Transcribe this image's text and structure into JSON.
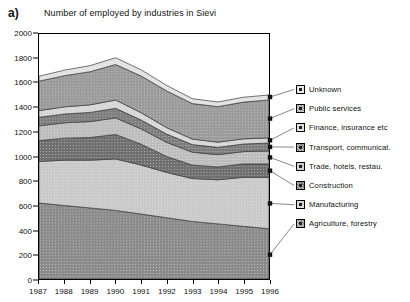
{
  "panel": {
    "label": "a)"
  },
  "chart_data": {
    "type": "area",
    "title": "Number of employed by industries in Sievi",
    "xlabel": "",
    "ylabel": "",
    "stacked": true,
    "grid": false,
    "legend_position": "right",
    "ylim": [
      0,
      2000
    ],
    "yticks": [
      0,
      200,
      400,
      600,
      800,
      1000,
      1200,
      1400,
      1600,
      1800,
      2000
    ],
    "categories": [
      "1987",
      "1988",
      "1989",
      "1990",
      "1991",
      "1992",
      "1993",
      "1994",
      "1995",
      "1996"
    ],
    "x": [
      1987,
      1988,
      1989,
      1990,
      1991,
      1992,
      1993,
      1994,
      1995,
      1996
    ],
    "series": [
      {
        "name": "Agriculture, forestry",
        "color": "#8a8a8a",
        "values": [
          620,
          600,
          580,
          560,
          530,
          500,
          470,
          450,
          430,
          410
        ]
      },
      {
        "name": "Manufacturing",
        "color": "#c9c9c9",
        "values": [
          340,
          370,
          390,
          420,
          400,
          370,
          350,
          360,
          400,
          420
        ]
      },
      {
        "name": "Construction",
        "color": "#6f6f6f",
        "values": [
          170,
          180,
          185,
          200,
          170,
          130,
          110,
          105,
          110,
          110
        ]
      },
      {
        "name": "Trade, hotels, restau.",
        "color": "#bdbdbd",
        "values": [
          120,
          125,
          130,
          135,
          125,
          115,
          105,
          100,
          100,
          105
        ]
      },
      {
        "name": "Transport, communicat.",
        "color": "#7d7d7d",
        "values": [
          70,
          72,
          75,
          78,
          72,
          68,
          62,
          60,
          62,
          65
        ]
      },
      {
        "name": "Finance, insurance etc",
        "color": "#d6d6d6",
        "values": [
          55,
          58,
          62,
          68,
          60,
          52,
          45,
          42,
          42,
          42
        ]
      },
      {
        "name": "Public services",
        "color": "#9a9a9a",
        "values": [
          240,
          255,
          270,
          290,
          300,
          300,
          290,
          290,
          300,
          310
        ]
      },
      {
        "name": "Unknown",
        "color": "#e2e2e2",
        "values": [
          40,
          45,
          50,
          55,
          50,
          45,
          40,
          38,
          40,
          40
        ]
      }
    ],
    "totals": [
      1655,
      1705,
      1742,
      1806,
      1707,
      1580,
      1472,
      1445,
      1484,
      1502
    ]
  },
  "legend": {
    "items": [
      {
        "label": "Unknown"
      },
      {
        "label": "Public services"
      },
      {
        "label": "Finance, insurance etc"
      },
      {
        "label": "Transport, communicat."
      },
      {
        "label": "Trade, hotels, restau."
      },
      {
        "label": "Construction"
      },
      {
        "label": "Manufacturing"
      },
      {
        "label": "Agriculture, forestry"
      }
    ]
  }
}
